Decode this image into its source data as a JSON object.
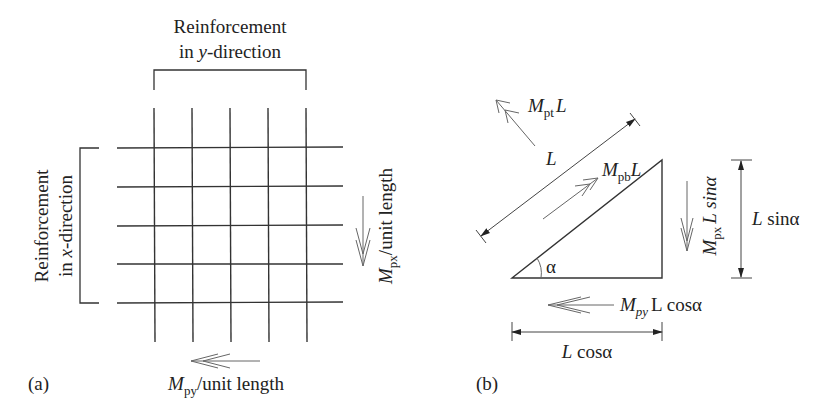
{
  "panel_a": {
    "label": "(a)",
    "y_reinforcement": {
      "line1": "Reinforcement",
      "line2_prefix": "in ",
      "line2_var": "y",
      "line2_suffix": "-direction"
    },
    "x_reinforcement": {
      "line1": "Reinforcement",
      "line2_prefix": "in ",
      "line2_var": "x",
      "line2_suffix": "-direction"
    },
    "mpx": {
      "symbol": "M",
      "subscript": "px",
      "suffix": "/unit length"
    },
    "mpy": {
      "symbol": "M",
      "subscript": "py",
      "suffix": "/unit length"
    },
    "grid": {
      "vertical_bars": 5,
      "horizontal_bars": 5
    }
  },
  "panel_b": {
    "label": "(b)",
    "mpt": {
      "symbol": "M",
      "subscript": "pt",
      "suffix": "L"
    },
    "mpb": {
      "symbol": "M",
      "subscript": "pb",
      "suffix": "L"
    },
    "length": "L",
    "angle": "α",
    "mpx_side": {
      "symbol": "M",
      "subscript": "px",
      "suffix": "L sinα"
    },
    "mpy_side": {
      "symbol": "M",
      "subscript": "py",
      "suffix": "L cosα"
    },
    "dim_vertical": "L sinα",
    "dim_horizontal": "L cosα"
  }
}
